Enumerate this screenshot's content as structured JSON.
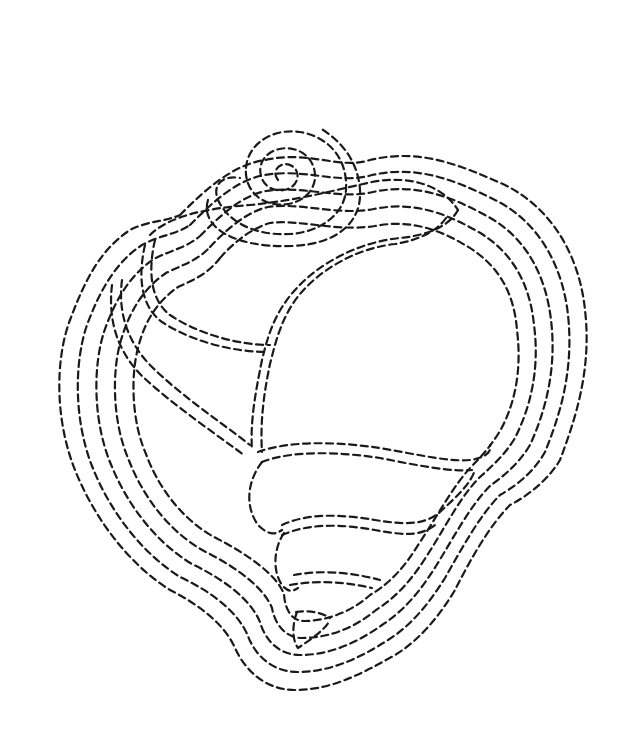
{
  "image": {
    "subject": "Seashell line drawing made of dashed lines",
    "style": "dashed outline, black on white",
    "stroke_color": "#1a1a1a",
    "background_color": "#ffffff",
    "outer_contour_count": 5
  }
}
